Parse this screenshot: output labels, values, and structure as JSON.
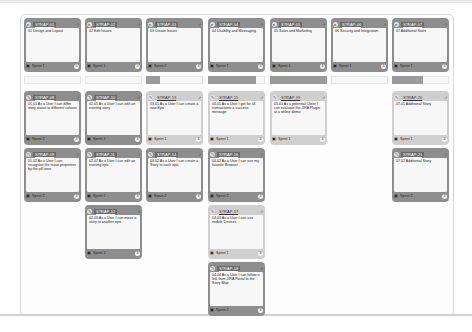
{
  "epics": [
    {
      "key": "STRAP-01",
      "title": "01 Design and Layout",
      "sprint": "Sprint 1",
      "points": "5"
    },
    {
      "key": "STRAP-02",
      "title": "02 Edit Issues",
      "sprint": "Sprint 1",
      "points": "2"
    },
    {
      "key": "STRAP-03",
      "title": "03 Create Issues",
      "sprint": "Sprint 2",
      "points": "3"
    },
    {
      "key": "STRAP-04",
      "title": "04 Usability and Messaging",
      "sprint": "Sprint 1",
      "points": "3"
    },
    {
      "key": "STRAP-05",
      "title": "05 Sales and Marketing",
      "sprint": "Sprint 1",
      "points": "3"
    },
    {
      "key": "STRAP-06",
      "title": "06 Security and Integration",
      "sprint": "Sprint 1",
      "points": "3"
    },
    {
      "key": "STRAP-07",
      "title": "07 Additional Stors",
      "sprint": "Sprint 1",
      "points": "3"
    }
  ],
  "progress": [
    0,
    0,
    0.25,
    0.85,
    1.0,
    0,
    0.55
  ],
  "stories": [
    {
      "key": "STRAP-08",
      "text": "01.01 As a User I can differ story status to different colours",
      "sprint": "Sprint 2",
      "points": "3",
      "style": "dark",
      "col": 0,
      "row": 0
    },
    {
      "key": "STRAP-09",
      "text": "01.02 As a User I can recognise the issue properties by the pill tone",
      "sprint": "Sprint 2",
      "points": "3",
      "style": "dark",
      "col": 0,
      "row": 1
    },
    {
      "key": "STRAP-10",
      "text": "02.01 As a User I can edit an existing story",
      "sprint": "Sprint 2",
      "points": "3",
      "style": "dark",
      "col": 1,
      "row": 0
    },
    {
      "key": "STRAP-11",
      "text": "02.02 As a User I can edit an existing epic",
      "sprint": "Sprint 2",
      "points": "3",
      "style": "dark",
      "col": 1,
      "row": 1
    },
    {
      "key": "STRAP-12",
      "text": "02.03 As a User I can move a story to another epic",
      "sprint": "Sprint 2",
      "points": "3",
      "style": "dark",
      "col": 1,
      "row": 2
    },
    {
      "key": "STRAP-13",
      "text": "03.01 As a User I can create a new Epic",
      "sprint": "Sprint 1",
      "points": "3",
      "style": "light",
      "col": 2,
      "row": 0
    },
    {
      "key": "STRAP-14",
      "text": "03.02 As a User I can create a Story to each epic",
      "sprint": "Sprint 2",
      "points": "3",
      "style": "dark",
      "col": 2,
      "row": 1
    },
    {
      "key": "STRAP-15",
      "text": "04.01 As a User I get for all transactions a success message",
      "sprint": "Sprint 1",
      "points": "3",
      "style": "light",
      "col": 3,
      "row": 0
    },
    {
      "key": "STRAP-16",
      "text": "04.02 As a User I can use my favorite Browser",
      "sprint": "Sprint 2",
      "points": "3",
      "style": "dark",
      "col": 3,
      "row": 1
    },
    {
      "key": "STRAP-17",
      "text": "04.03 As a User I can use mobile Devices",
      "sprint": "Sprint 1",
      "points": "3",
      "style": "light",
      "col": 3,
      "row": 2
    },
    {
      "key": "STRAP-18",
      "text": "04.04 As a User I can follow a link from JIRA Portal to the Story Map",
      "sprint": "Sprint 2",
      "points": "3",
      "style": "dark",
      "col": 3,
      "row": 3
    },
    {
      "key": "STRAP-19",
      "text": "05.01 As a potential Client I can evaluate the JIRA Plugin at a online demo",
      "sprint": "Sprint 1",
      "points": "3",
      "style": "light",
      "col": 4,
      "row": 0
    },
    {
      "key": "STRAP-20",
      "text": "07.01 Additional Story",
      "sprint": "Sprint 1",
      "points": "3",
      "style": "light",
      "col": 6,
      "row": 0
    },
    {
      "key": "STRAP-21",
      "text": "07.02 Additional Story",
      "sprint": "Sprint 2",
      "points": "3",
      "style": "dark",
      "col": 6,
      "row": 1
    }
  ]
}
